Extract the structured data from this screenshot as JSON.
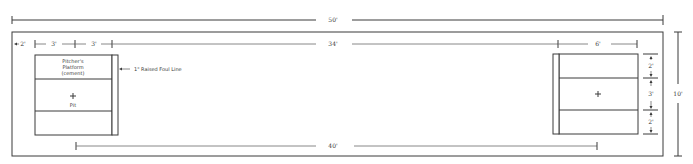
{
  "diagram": {
    "title": "",
    "dimensions": {
      "overall_length": "50'",
      "inner_span": "34'",
      "pit_to_pit": "40'",
      "width": "10'",
      "left_margin": "2'",
      "platform_depth": "3'",
      "pit_depth": "3'",
      "right_box_width": "6'",
      "right_top": "2'",
      "right_middle": "3'",
      "right_bottom": "2'"
    },
    "left_box": {
      "top_label_line1": "Pitcher's",
      "top_label_line2": "Platform",
      "top_label_line3": "(cement)",
      "center_marker": "+",
      "pit_label": "Pit"
    },
    "callout": {
      "foul_line": "1\" Raised Foul Line"
    },
    "right_box": {
      "center_marker": "+"
    }
  }
}
